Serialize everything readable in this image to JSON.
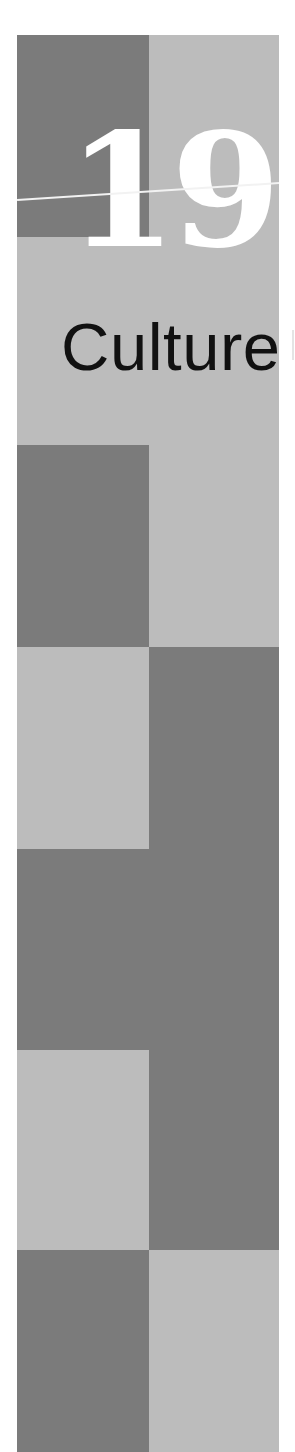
{
  "chapter": {
    "number": "19",
    "title": "Culture,"
  },
  "colors": {
    "background": "#ffffff",
    "dark_block": "#7b7b7b",
    "light_block": "#bcbcbc",
    "numeral": "#ffffff",
    "title_text": "#111111"
  },
  "layout": {
    "strip": {
      "x": 17,
      "y": 35,
      "width": 262,
      "height": 1417
    },
    "column_split_x": 149,
    "blocks": [
      {
        "col": "left",
        "tone": "dark",
        "y_start": 35,
        "y_end": 237
      },
      {
        "col": "right",
        "tone": "light",
        "y_start": 35,
        "y_end": 445
      },
      {
        "col": "left",
        "tone": "light",
        "y_start": 237,
        "y_end": 445
      },
      {
        "col": "left",
        "tone": "dark",
        "y_start": 445,
        "y_end": 647
      },
      {
        "col": "right",
        "tone": "light",
        "y_start": 445,
        "y_end": 647
      },
      {
        "col": "left",
        "tone": "light",
        "y_start": 647,
        "y_end": 849
      },
      {
        "col": "right",
        "tone": "dark",
        "y_start": 647,
        "y_end": 1250
      },
      {
        "col": "left",
        "tone": "dark",
        "y_start": 849,
        "y_end": 1050
      },
      {
        "col": "left",
        "tone": "light",
        "y_start": 1050,
        "y_end": 1250
      },
      {
        "col": "left",
        "tone": "dark",
        "y_start": 1250,
        "y_end": 1452
      },
      {
        "col": "right",
        "tone": "light",
        "y_start": 1250,
        "y_end": 1452
      }
    ]
  }
}
